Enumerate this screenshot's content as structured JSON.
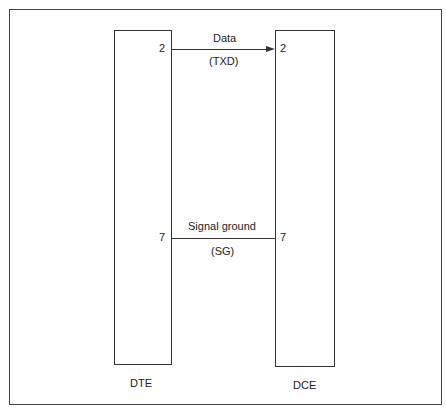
{
  "diagram": {
    "devices": [
      {
        "name": "DTE"
      },
      {
        "name": "DCE"
      }
    ],
    "connections": [
      {
        "pin_left": "2",
        "pin_right": "2",
        "label": "Data",
        "sublabel": "(TXD)",
        "direction": "DTE-to-DCE"
      },
      {
        "pin_left": "7",
        "pin_right": "7",
        "label": "Signal ground",
        "sublabel": "(SG)",
        "direction": "none"
      }
    ]
  }
}
